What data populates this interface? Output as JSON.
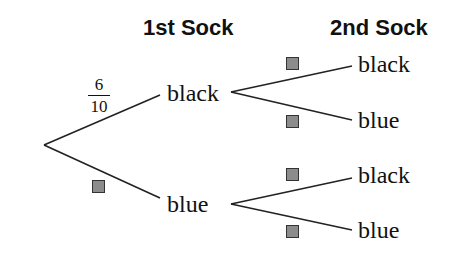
{
  "headers": {
    "first": "1st Sock",
    "second": "2nd Sock"
  },
  "first_level": {
    "top": {
      "label": "black",
      "probability_numerator": "6",
      "probability_denominator": "10"
    },
    "bottom": {
      "label": "blue",
      "probability": "blank-box"
    }
  },
  "second_level": {
    "from_black": {
      "top": {
        "label": "black",
        "probability": "blank-box"
      },
      "bottom": {
        "label": "blue",
        "probability": "blank-box"
      }
    },
    "from_blue": {
      "top": {
        "label": "black",
        "probability": "blank-box"
      },
      "bottom": {
        "label": "blue",
        "probability": "blank-box"
      }
    }
  },
  "colors": {
    "line": "#222222",
    "box_fill": "#8c8c8c",
    "box_border": "#333333"
  }
}
